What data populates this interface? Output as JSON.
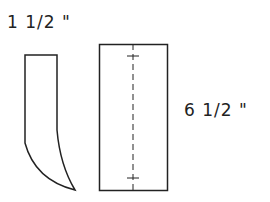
{
  "diagram": {
    "labels": {
      "width": "1 1/2 \"",
      "length": "6 1/2 \""
    },
    "colors": {
      "stroke": "#222222",
      "background": "#ffffff"
    },
    "shapes": [
      {
        "name": "curved-strip-piece",
        "type": "curved-strip"
      },
      {
        "name": "rectangle-piece",
        "type": "rectangle",
        "has_center_fold_line": true
      }
    ]
  }
}
